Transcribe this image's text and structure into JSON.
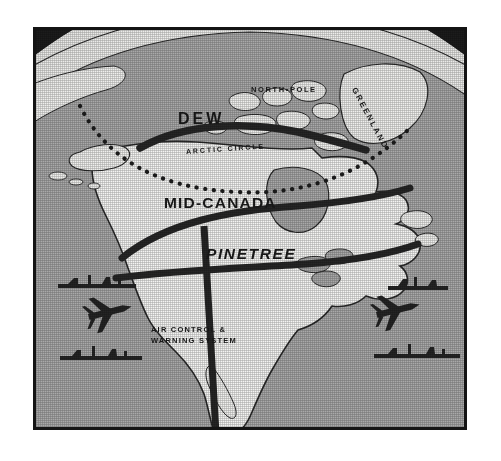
{
  "figure": {
    "kind": "map-illustration",
    "background_color": "#1d1d1d",
    "ocean_color": "#a9a9a9",
    "land_color": "#f4f4f2",
    "line_color": "#262626",
    "frame_color": "#141414",
    "page_color": "#ffffff"
  },
  "labels": {
    "north_pole": "NORTH•POLE",
    "greenland": "GREENLAND",
    "arctic_circle": "ARCTIC  CIRCLE",
    "dew": "DEW",
    "mid_canada": "MID-CANADA",
    "pinetree": "PINETREE",
    "air_control_line1": "AIR CONTROL &",
    "air_control_line2": "WARNING SYSTEM"
  },
  "map_features": {
    "radar_lines": [
      {
        "name": "DEW Line",
        "label": "DEW",
        "position": "arctic-coast"
      },
      {
        "name": "Mid-Canada Line",
        "label": "MID-CANADA",
        "position": "central-canada"
      },
      {
        "name": "Pinetree Line",
        "label": "PINETREE",
        "position": "canada-us-border"
      }
    ],
    "reference_lines": [
      {
        "name": "Arctic Circle",
        "style": "dotted"
      }
    ],
    "vertical_line": {
      "name": "Air Control & Warning System",
      "style": "thick-vertical-bar"
    },
    "icons": [
      {
        "name": "aircraft",
        "side": "pacific"
      },
      {
        "name": "aircraft",
        "side": "atlantic"
      },
      {
        "name": "warship",
        "side": "pacific-north"
      },
      {
        "name": "warship",
        "side": "pacific-south"
      },
      {
        "name": "warship",
        "side": "atlantic-north"
      },
      {
        "name": "warship",
        "side": "atlantic-south"
      }
    ]
  }
}
